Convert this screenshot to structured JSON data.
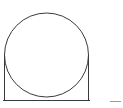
{
  "diagram": {
    "stroke_color": "#3a3a3a",
    "background": "#ffffff",
    "circle": {
      "cx": 46.5,
      "cy": 55,
      "r": 42
    },
    "frame": {
      "left_x": 4,
      "right_x": 89,
      "top_y": 55,
      "base_y": 100
    },
    "corner_mark": {
      "text": "———",
      "color": "#8a8a8a"
    }
  }
}
